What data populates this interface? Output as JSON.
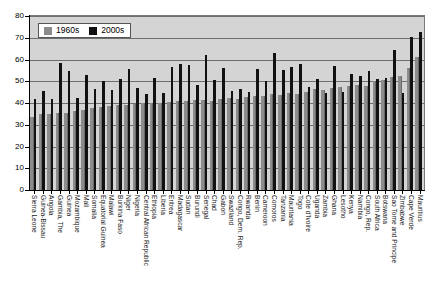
{
  "chart_data": {
    "type": "bar",
    "title": "",
    "xlabel": "",
    "ylabel": "",
    "ylim": [
      0,
      80
    ],
    "yticks": [
      0,
      10,
      20,
      30,
      40,
      50,
      60,
      70,
      80
    ],
    "grid": true,
    "legend_position": "top-left",
    "categories": [
      "Sierra Leone",
      "Guinea-Bissau",
      "Angola",
      "Gambia, The",
      "Guinea",
      "Mozambique",
      "Mali",
      "Somalia",
      "Equatorial Guinea",
      "Malawi",
      "Burkina Faso",
      "Niger",
      "Nigeria",
      "Central African Republic",
      "Ethiopia",
      "Liberia",
      "Eritrea",
      "Madagascar",
      "Sudan",
      "Burundi",
      "Senegal",
      "Chad",
      "Gabon",
      "Swaziland",
      "Congo, Dem. Rep.",
      "Rwanda",
      "Benin",
      "Cameroon",
      "Comoros",
      "Tanzania",
      "Mauritania",
      "Togo",
      "Cote d'Ivoire",
      "Uganda",
      "Zambia",
      "Ghana",
      "Lesotho",
      "Kenya",
      "Namibia",
      "Congo, Rep.",
      "South Africa",
      "Botswana",
      "Sao Tome and Principe",
      "Zimbabwe",
      "Cape Verde",
      "Mauritius"
    ],
    "series": [
      {
        "name": "1960s",
        "color": "#8c8c8c",
        "values": [
          33.5,
          35.0,
          35.0,
          35.2,
          35.5,
          36.5,
          37.0,
          37.5,
          38.0,
          38.5,
          39.0,
          39.2,
          39.5,
          39.8,
          40.0,
          40.2,
          40.5,
          41.0,
          40.8,
          41.2,
          41.5,
          41.0,
          42.0,
          42.5,
          42.0,
          42.8,
          43.0,
          43.2,
          44.0,
          43.5,
          44.5,
          44.0,
          45.0,
          46.5,
          46.0,
          47.0,
          47.5,
          48.0,
          48.5,
          48.0,
          50.0,
          50.5,
          52.0,
          52.5,
          56.0,
          61.0
        ]
      },
      {
        "name": "2000s",
        "color": "#111111",
        "values": [
          41.8,
          45.5,
          41.8,
          58.5,
          54.5,
          42.5,
          53.0,
          46.5,
          50.0,
          46.2,
          51.0,
          55.5,
          46.8,
          44.0,
          51.5,
          44.5,
          56.5,
          58.0,
          57.5,
          48.2,
          62.0,
          50.5,
          56.0,
          45.5,
          46.5,
          45.0,
          55.5,
          50.0,
          63.0,
          55.0,
          56.5,
          58.0,
          47.5,
          51.0,
          44.5,
          57.0,
          45.0,
          53.5,
          52.5,
          54.5,
          51.0,
          51.5,
          64.5,
          44.5,
          70.5,
          72.5
        ]
      }
    ],
    "legend": [
      {
        "label": "1960s",
        "swatch": "gray-swatch"
      },
      {
        "label": "2000s",
        "swatch": "black-swatch"
      }
    ]
  }
}
